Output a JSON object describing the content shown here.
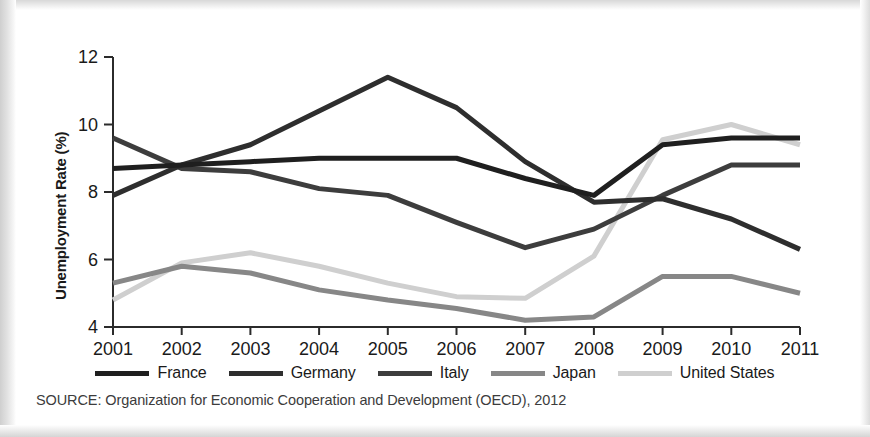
{
  "figure": {
    "ylabel": "Unemployment Rate (%)",
    "source_note": "SOURCE: Organization for Economic Cooperation and Development (OECD), 2012"
  },
  "legend": {
    "position": "bottom",
    "items": [
      {
        "label": "France",
        "color": "#1f1f1f"
      },
      {
        "label": "Germany",
        "color": "#2e2e2e"
      },
      {
        "label": "Italy",
        "color": "#3d3d3d"
      },
      {
        "label": "Japan",
        "color": "#878787"
      },
      {
        "label": "United States",
        "color": "#cfcfcf"
      }
    ]
  },
  "axes": {
    "x_ticks": [
      "2001",
      "2002",
      "2003",
      "2004",
      "2005",
      "2006",
      "2007",
      "2008",
      "2009",
      "2010",
      "2011"
    ],
    "y_ticks": [
      "4",
      "6",
      "8",
      "10",
      "12"
    ]
  },
  "chart_data": {
    "type": "line",
    "title": "",
    "xlabel": "",
    "ylabel": "Unemployment Rate (%)",
    "xlim": [
      2001,
      2011
    ],
    "ylim": [
      4,
      12
    ],
    "grid": false,
    "legend_position": "bottom",
    "x": [
      2001,
      2002,
      2003,
      2004,
      2005,
      2006,
      2007,
      2008,
      2009,
      2010,
      2011
    ],
    "categories": [
      "2001",
      "2002",
      "2003",
      "2004",
      "2005",
      "2006",
      "2007",
      "2008",
      "2009",
      "2010",
      "2011"
    ],
    "series": [
      {
        "name": "France",
        "color": "#1f1f1f",
        "values": [
          8.7,
          8.8,
          8.9,
          9.0,
          9.0,
          9.0,
          8.4,
          7.9,
          9.4,
          9.6,
          9.6
        ]
      },
      {
        "name": "Germany",
        "color": "#2e2e2e",
        "values": [
          7.9,
          8.8,
          9.4,
          10.4,
          11.4,
          10.5,
          8.9,
          7.7,
          7.8,
          7.2,
          6.3
        ]
      },
      {
        "name": "Italy",
        "color": "#3d3d3d",
        "values": [
          9.6,
          8.7,
          8.6,
          8.1,
          7.9,
          7.1,
          6.35,
          6.9,
          7.9,
          8.8,
          8.8
        ]
      },
      {
        "name": "Japan",
        "color": "#878787",
        "values": [
          5.3,
          5.8,
          5.6,
          5.1,
          4.8,
          4.55,
          4.2,
          4.3,
          5.5,
          5.5,
          5.0
        ]
      },
      {
        "name": "United States",
        "color": "#cfcfcf",
        "values": [
          4.8,
          5.9,
          6.2,
          5.8,
          5.3,
          4.9,
          4.85,
          6.1,
          9.55,
          10.0,
          9.4
        ]
      }
    ]
  }
}
